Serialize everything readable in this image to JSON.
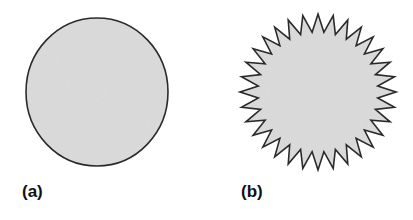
{
  "figure": {
    "panels": [
      {
        "label": "(a)",
        "shape": "circle",
        "description": "smooth circle"
      },
      {
        "label": "(b)",
        "shape": "spiky-star",
        "description": "spiky circle",
        "spikes": 32
      }
    ],
    "colors": {
      "fill": "#dcdcdc",
      "stroke": "#2a2a2a",
      "background": "#ffffff"
    }
  }
}
